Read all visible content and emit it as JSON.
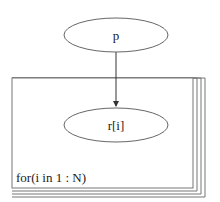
{
  "diagram": {
    "type": "plate-notation",
    "nodes": [
      {
        "id": "p",
        "label": "p",
        "cx": 116,
        "cy": 35,
        "rx": 52,
        "ry": 17
      },
      {
        "id": "r",
        "label": "r[i]",
        "cx": 116,
        "cy": 125,
        "rx": 52,
        "ry": 17
      }
    ],
    "edges": [
      {
        "from": "p",
        "to": "r"
      }
    ],
    "plate": {
      "label": "for(i in 1 : N)",
      "stack_count": 4
    }
  },
  "colors": {
    "stroke": "#666666",
    "text": "#222222",
    "background": "#ffffff"
  }
}
